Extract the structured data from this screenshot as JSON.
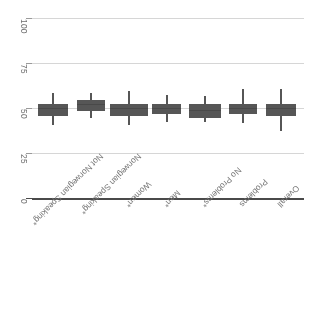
{
  "chart_data": {
    "type": "box",
    "title": "",
    "xlabel": "",
    "ylabel": "",
    "orientation": "rotated-180",
    "grid": true,
    "legend": "none",
    "ylim": [
      0,
      100
    ],
    "yticks": [
      0,
      25,
      50,
      75,
      100
    ],
    "ytick_labels": [
      "0",
      "25",
      "50",
      "75",
      "100"
    ],
    "categories": [
      "Overall",
      "Problems",
      "No Problems*",
      "Men*",
      "Women*",
      "Norwegian Speaking*",
      "Not Norwegian Speaking*"
    ],
    "boxes": [
      {
        "category": "Overall",
        "whisker_low": 38,
        "q1": 46,
        "median": 50,
        "q3": 53,
        "whisker_high": 61
      },
      {
        "category": "Problems",
        "whisker_low": 42,
        "q1": 47,
        "median": 50,
        "q3": 53,
        "whisker_high": 61
      },
      {
        "category": "No Problems*",
        "whisker_low": 43,
        "q1": 45,
        "median": 49,
        "q3": 53,
        "whisker_high": 57
      },
      {
        "category": "Men*",
        "whisker_low": 43,
        "q1": 47,
        "median": 50,
        "q3": 53,
        "whisker_high": 58
      },
      {
        "category": "Women*",
        "whisker_low": 41,
        "q1": 46,
        "median": 50,
        "q3": 53,
        "whisker_high": 60
      },
      {
        "category": "Norwegian Speaking*",
        "whisker_low": 45,
        "q1": 49,
        "median": 52,
        "q3": 55,
        "whisker_high": 59
      },
      {
        "category": "Not Norwegian Speaking*",
        "whisker_low": 41,
        "q1": 46,
        "median": 50,
        "q3": 53,
        "whisker_high": 59
      }
    ],
    "colors": {
      "box_fill": "#565656",
      "whisker": "#565656",
      "grid": "#d6d6d6",
      "axis": "#4a4a4a",
      "tick_text": "#6f6f6f",
      "category_text": "#757575",
      "background": "#ffffff"
    }
  }
}
